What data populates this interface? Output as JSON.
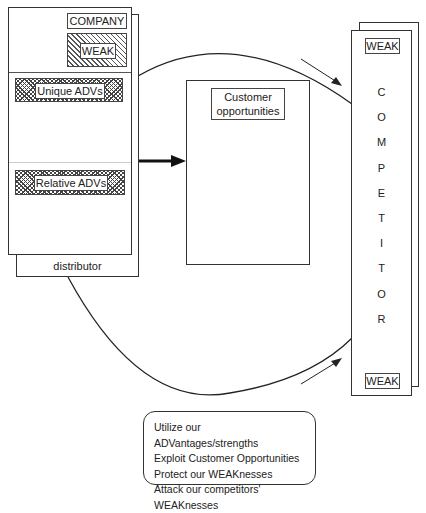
{
  "company": {
    "title": "COMPANY",
    "weak_label": "WEAK",
    "unique_advs": "Unique ADVs",
    "relative_advs": "Relative ADVs",
    "distributor": "distributor"
  },
  "center": {
    "customer_opportunities": "Customer opportunities"
  },
  "competitor": {
    "weak_top": "WEAK",
    "weak_bottom": "WEAK",
    "letters": [
      "C",
      "O",
      "M",
      "P",
      "E",
      "T",
      "I",
      "T",
      "O",
      "R"
    ]
  },
  "summary": {
    "lines": [
      "Utilize our ADVantages/strengths",
      "Exploit Customer Opportunities",
      "Protect our WEAKnesses",
      "Attack our competitors' WEAKnesses"
    ]
  }
}
